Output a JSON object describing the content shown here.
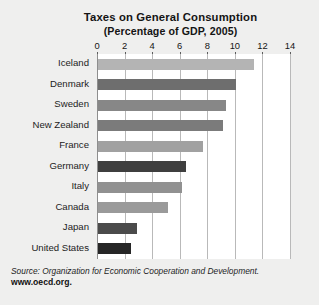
{
  "chart_data": {
    "type": "bar",
    "orientation": "horizontal",
    "title": "Taxes on General Consumption",
    "subtitle": "(Percentage of GDP, 2005)",
    "xlabel": "",
    "ylabel": "",
    "xlim": [
      0,
      14
    ],
    "xticks": [
      0,
      2,
      4,
      6,
      8,
      10,
      12,
      14
    ],
    "xtick_labels": [
      "0",
      "2",
      "4",
      "6",
      "8",
      "10",
      "12",
      "14"
    ],
    "grid": true,
    "legend": "none",
    "categories": [
      "Iceland",
      "Denmark",
      "Sweden",
      "New Zealand",
      "France",
      "Germany",
      "Italy",
      "Canada",
      "Japan",
      "United States"
    ],
    "values": [
      11.3,
      10.0,
      9.3,
      9.1,
      7.6,
      6.4,
      6.1,
      5.1,
      2.8,
      2.4
    ],
    "bar_colors": [
      "#b4b4b4",
      "#6e6e6e",
      "#878787",
      "#7b7b7b",
      "#a1a1a1",
      "#3f3f3f",
      "#919191",
      "#9a9a9a",
      "#4b4b4b",
      "#262626"
    ]
  },
  "source": {
    "text": "Source: Organization for Economic Cooperation and Development.",
    "url": "www.oecd.org."
  },
  "colors": {
    "background": "#efefee",
    "plot_background": "#ffffff",
    "gridline": "#b9b9b9",
    "axis": "#8e8e8e",
    "text": "#1a1a1a"
  }
}
